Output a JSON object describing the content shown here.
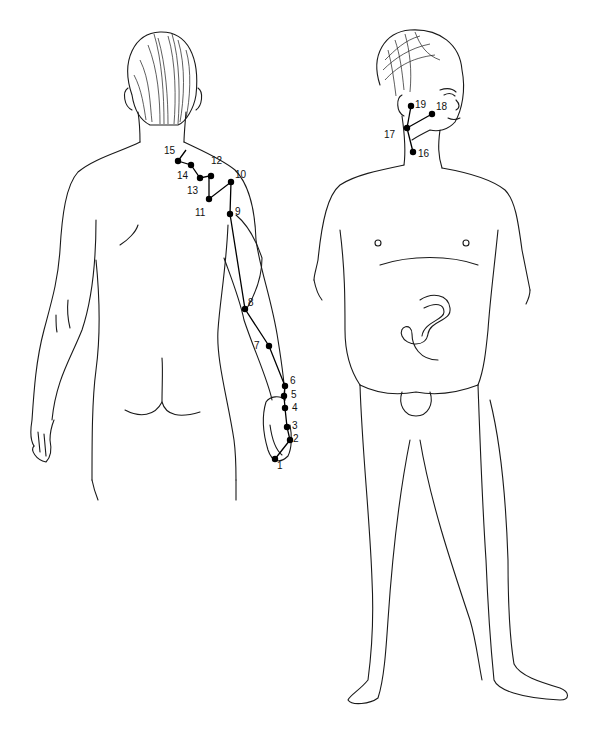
{
  "figure": {
    "views": [
      {
        "id": "back-view",
        "label": "Back view of body with arm and shoulder points"
      },
      {
        "id": "front-view",
        "label": "Front view of body with face and neck points"
      }
    ],
    "points": [
      {
        "n": "1",
        "x": 275,
        "y": 459,
        "lx": 277,
        "ly": 464
      },
      {
        "n": "2",
        "x": 290,
        "y": 440,
        "lx": 293,
        "ly": 436
      },
      {
        "n": "3",
        "x": 287,
        "y": 427,
        "lx": 293,
        "ly": 422
      },
      {
        "n": "4",
        "x": 285,
        "y": 408,
        "lx": 293,
        "ly": 404
      },
      {
        "n": "5",
        "x": 284,
        "y": 396,
        "lx": 291,
        "ly": 391
      },
      {
        "n": "6",
        "x": 285,
        "y": 386,
        "lx": 290,
        "ly": 377
      },
      {
        "n": "7",
        "x": 269,
        "y": 346,
        "lx": 254,
        "ly": 342
      },
      {
        "n": "8",
        "x": 245,
        "y": 309,
        "lx": 248,
        "ly": 299
      },
      {
        "n": "9",
        "x": 230,
        "y": 214,
        "lx": 235,
        "ly": 207
      },
      {
        "n": "10",
        "x": 231,
        "y": 182,
        "lx": 236,
        "ly": 170
      },
      {
        "n": "11",
        "x": 209,
        "y": 199,
        "lx": 196,
        "ly": 208
      },
      {
        "n": "12",
        "x": 212,
        "y": 168,
        "lx": 212,
        "ly": 155
      },
      {
        "n": "13",
        "x": 211,
        "y": 175,
        "lx": 187,
        "ly": 186
      },
      {
        "n": "14",
        "x": 191,
        "y": 165,
        "lx": 177,
        "ly": 171
      },
      {
        "n": "15",
        "x": 178,
        "y": 161,
        "lx": 165,
        "ly": 146
      },
      {
        "n": "16",
        "x": 413,
        "y": 152,
        "lx": 418,
        "ly": 150
      },
      {
        "n": "17",
        "x": 407,
        "y": 128,
        "lx": 385,
        "ly": 131
      },
      {
        "n": "18",
        "x": 432,
        "y": 114,
        "lx": 436,
        "ly": 102
      },
      {
        "n": "19",
        "x": 411,
        "y": 106,
        "lx": 415,
        "ly": 100
      }
    ]
  }
}
